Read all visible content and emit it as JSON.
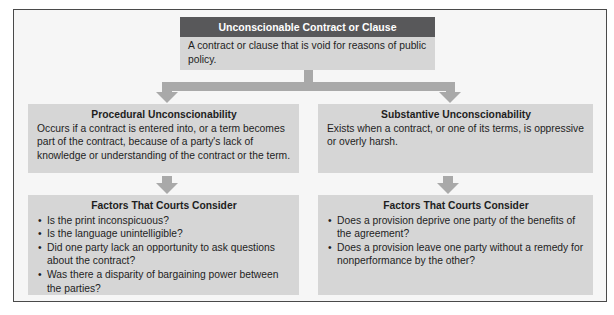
{
  "diagram": {
    "root": {
      "title": "Unconscionable Contract or Clause",
      "description": "A contract or clause that is void for reasons of public policy."
    },
    "branches": [
      {
        "title": "Procedural Unconscionability",
        "description": "Occurs if a contract is entered into, or a term becomes part of the contract, because of a party's lack of knowledge or understanding of the contract or the term.",
        "factors": {
          "title": "Factors That Courts Consider",
          "items": [
            "Is the print inconspicuous?",
            "Is the language unintelligible?",
            "Did one party lack an opportunity to ask questions about the contract?",
            "Was there a disparity of bargaining power between the parties?"
          ]
        }
      },
      {
        "title": "Substantive Unconscionability",
        "description": "Exists when a contract, or one of its terms, is oppressive or overly harsh.",
        "factors": {
          "title": "Factors That Courts Consider",
          "items": [
            "Does a provision deprive one party of the benefits of the agreement?",
            "Does a provision leave one party without a remedy for nonperformance by the other?"
          ]
        }
      }
    ],
    "bullet_glyph": "•"
  },
  "colors": {
    "header_bg": "#58585a",
    "box_bg": "#d6d6d6",
    "arrow": "#a9a9a9",
    "frame_bg": "#f6f6f6",
    "frame_border": "#4a4a4a"
  }
}
